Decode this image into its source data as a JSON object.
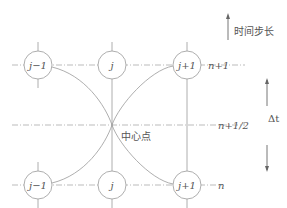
{
  "diagram": {
    "type": "finite-difference stencil (leapfrog / midpoint scheme)",
    "nodes_top": [
      {
        "label": "j−1"
      },
      {
        "label": "j"
      },
      {
        "label": "j+1"
      }
    ],
    "nodes_bottom": [
      {
        "label": "j−1"
      },
      {
        "label": "j"
      },
      {
        "label": "j+1"
      }
    ],
    "row_labels": {
      "top": "n+1",
      "middle": "n+1/2",
      "bottom": "n"
    },
    "center_label": "中心点",
    "time_step_label": "时间步长",
    "delta_t_label": "Δt",
    "colors": {
      "line": "#999999",
      "text": "#555555",
      "background": "#ffffff"
    }
  }
}
